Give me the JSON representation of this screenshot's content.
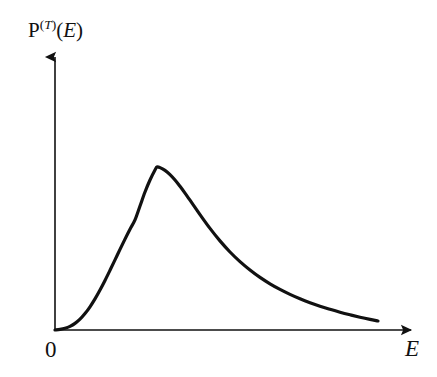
{
  "figure": {
    "kind": "line-plot",
    "background_color": "#ffffff",
    "ink_color": "#111111",
    "width": 437,
    "height": 377
  },
  "labels": {
    "y_axis": {
      "function_name": "P",
      "superscript_open": "(",
      "superscript_var": "T",
      "superscript_close": ")",
      "argument_open": "(",
      "argument_var": "E",
      "argument_close": ")",
      "full_text": "P^(T)(E)"
    },
    "x_axis": "E",
    "origin": "0"
  },
  "axes": {
    "y": {
      "x": 55,
      "y_bottom": 330,
      "y_top": 48,
      "arrow": "up"
    },
    "x": {
      "y": 330,
      "x_left": 55,
      "x_right": 420,
      "arrow": "right"
    },
    "line_width": 1.6,
    "arrow_size": 9
  },
  "chart_data": {
    "type": "line",
    "title": "",
    "xlabel": "E",
    "ylabel": "P^(T)(E)",
    "grid": false,
    "legend": null,
    "annotations": [
      "0"
    ],
    "axis_ticks": {
      "x": [],
      "y": []
    },
    "xlim": [
      0,
      1
    ],
    "ylim": [
      0,
      1
    ],
    "series": [
      {
        "name": "P^(T)(E)",
        "color": "#111111",
        "line_width": 3.2,
        "points_px": [
          [
            55,
            330
          ],
          [
            60,
            329.4
          ],
          [
            65,
            328.3
          ],
          [
            70,
            326.4
          ],
          [
            75,
            323.4
          ],
          [
            80,
            319.2
          ],
          [
            85,
            313.6
          ],
          [
            90,
            306.8
          ],
          [
            95,
            298.9
          ],
          [
            100,
            290.0
          ],
          [
            105,
            280.4
          ],
          [
            110,
            270.3
          ],
          [
            115,
            259.9
          ],
          [
            120,
            249.4
          ],
          [
            125,
            239.1
          ],
          [
            130,
            229.2
          ],
          [
            135,
            219.9
          ],
          [
            140,
            206.0
          ],
          [
            145,
            192.0
          ],
          [
            150,
            180.0
          ],
          [
            155,
            170.0
          ],
          [
            157,
            167.0
          ],
          [
            160,
            167.6
          ],
          [
            165,
            170.4
          ],
          [
            170,
            174.6
          ],
          [
            175,
            180.0
          ],
          [
            180,
            186.3
          ],
          [
            185,
            193.1
          ],
          [
            190,
            200.2
          ],
          [
            195,
            207.4
          ],
          [
            200,
            214.6
          ],
          [
            210,
            228.4
          ],
          [
            220,
            240.9
          ],
          [
            230,
            252.0
          ],
          [
            240,
            261.6
          ],
          [
            250,
            270.0
          ],
          [
            260,
            277.4
          ],
          [
            270,
            283.8
          ],
          [
            280,
            289.4
          ],
          [
            290,
            294.4
          ],
          [
            300,
            298.8
          ],
          [
            310,
            302.7
          ],
          [
            320,
            306.2
          ],
          [
            330,
            309.3
          ],
          [
            340,
            312.2
          ],
          [
            350,
            314.8
          ],
          [
            360,
            317.2
          ],
          [
            370,
            319.4
          ],
          [
            378,
            321.0
          ]
        ],
        "normalized_points": [
          [
            0.0,
            0.0
          ],
          [
            0.14,
            0.21
          ],
          [
            0.22,
            0.43
          ],
          [
            0.28,
            0.7
          ],
          [
            0.31,
            0.9
          ],
          [
            0.34,
            1.0
          ],
          [
            0.4,
            0.83
          ],
          [
            0.45,
            0.73
          ],
          [
            0.51,
            0.58
          ],
          [
            0.6,
            0.44
          ],
          [
            0.69,
            0.33
          ],
          [
            0.78,
            0.24
          ],
          [
            0.87,
            0.17
          ],
          [
            0.95,
            0.12
          ],
          [
            1.0,
            0.09
          ]
        ]
      }
    ]
  }
}
